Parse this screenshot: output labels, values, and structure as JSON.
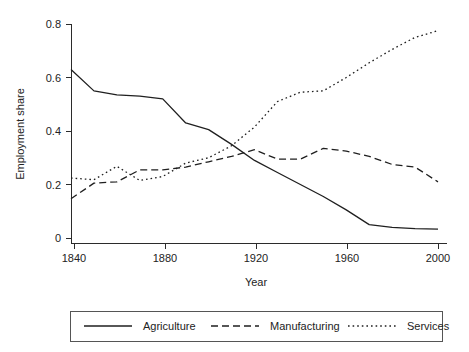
{
  "chart_data": {
    "type": "line",
    "title": "",
    "xlabel": "Year",
    "ylabel": "Employment share",
    "xlim": [
      1840,
      2000
    ],
    "ylim": [
      0,
      0.8
    ],
    "xticks": [
      1840,
      1880,
      1920,
      1960,
      2000
    ],
    "xtick_labels": [
      "1840",
      "1880",
      "1920",
      "1960",
      "2000"
    ],
    "yticks": [
      0,
      0.2,
      0.4,
      0.6,
      0.8
    ],
    "ytick_labels": [
      "0",
      "0.2",
      "0.4",
      "0.6",
      "0.8"
    ],
    "grid": false,
    "legend_position": "below-plot",
    "x": [
      1840,
      1850,
      1860,
      1870,
      1880,
      1890,
      1900,
      1910,
      1920,
      1930,
      1940,
      1950,
      1960,
      1970,
      1980,
      1990,
      2000
    ],
    "series": [
      {
        "name": "Agriculture",
        "linestyle": "solid",
        "color": "#1f1f1f",
        "values": [
          0.63,
          0.55,
          0.535,
          0.53,
          0.52,
          0.43,
          0.405,
          0.35,
          0.29,
          0.245,
          0.2,
          0.155,
          0.105,
          0.05,
          0.04,
          0.035,
          0.033
        ]
      },
      {
        "name": "Manufacturing",
        "linestyle": "dashed",
        "color": "#1f1f1f",
        "values": [
          0.147,
          0.205,
          0.21,
          0.255,
          0.255,
          0.265,
          0.285,
          0.305,
          0.33,
          0.295,
          0.295,
          0.335,
          0.325,
          0.305,
          0.275,
          0.265,
          0.21
        ]
      },
      {
        "name": "Services",
        "linestyle": "dotted",
        "color": "#1f1f1f",
        "values": [
          0.224,
          0.218,
          0.268,
          0.215,
          0.23,
          0.28,
          0.3,
          0.345,
          0.415,
          0.51,
          0.545,
          0.55,
          0.6,
          0.655,
          0.705,
          0.75,
          0.775
        ]
      }
    ]
  },
  "legend": {
    "entries": [
      {
        "label": "Agriculture",
        "style": "solid"
      },
      {
        "label": "Manufacturing",
        "style": "dashed"
      },
      {
        "label": "Services",
        "style": "dotted"
      }
    ]
  }
}
